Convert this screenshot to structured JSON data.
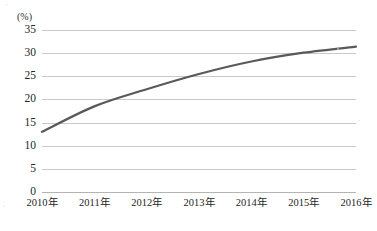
{
  "chart_data": {
    "type": "line",
    "title": "",
    "xlabel": "",
    "ylabel": "",
    "yunit": "(%)",
    "categories": [
      "2010年",
      "2011年",
      "2012年",
      "2013年",
      "2014年",
      "2015年",
      "2016年"
    ],
    "values": [
      13.0,
      18.5,
      22.2,
      25.5,
      28.2,
      30.1,
      31.4
    ],
    "ylim": [
      0,
      35
    ],
    "ytick_values": [
      0,
      5,
      10,
      15,
      20,
      25,
      30,
      35
    ],
    "ytick_labels": [
      "0",
      "5",
      "10",
      "15",
      "20",
      "25",
      "30",
      "35"
    ],
    "grid": true,
    "legend": false,
    "legend_position": "none",
    "series": [
      {
        "name": "",
        "values": [
          13.0,
          18.5,
          22.2,
          25.5,
          28.2,
          30.1,
          31.4
        ],
        "color": "#595959",
        "line_width": 2.2,
        "smooth": true,
        "markers": false
      }
    ]
  },
  "style": {
    "background": "#ffffff",
    "gridline_color": "#c9c9c9",
    "baseline_color": "#b4b4b4",
    "line_color": "#595959",
    "text_color": "#262626"
  },
  "caption": {
    "text": ""
  }
}
